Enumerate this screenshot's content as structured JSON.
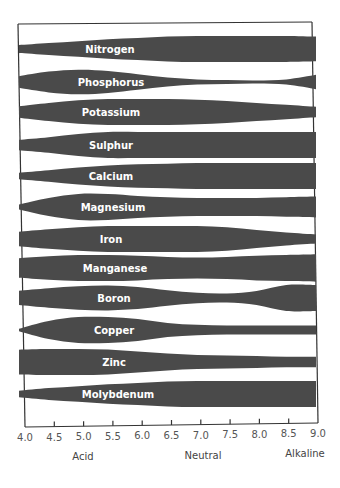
{
  "chart_data": {
    "type": "area",
    "title": "",
    "xlabel": "",
    "ylabel": "",
    "x_ticks": [
      "4.0",
      "4.5",
      "5.0",
      "5.5",
      "6.0",
      "6.5",
      "7.0",
      "7.5",
      "8.0",
      "8.5",
      "9.0"
    ],
    "xlim": [
      4.0,
      9.0
    ],
    "zone_labels": [
      {
        "label": "Acid",
        "at": 5.0
      },
      {
        "label": "Neutral",
        "at": 7.0
      },
      {
        "label": "Alkaline",
        "at": 9.0
      }
    ],
    "grid": false,
    "legend": "none",
    "band_color": "#4a4a4a",
    "x": [
      4.0,
      4.5,
      5.0,
      5.5,
      6.0,
      6.5,
      7.0,
      7.5,
      8.0,
      8.5,
      9.0
    ],
    "series": [
      {
        "name": "Nitrogen",
        "center_y": 49,
        "values": [
          0.3,
          0.45,
          0.6,
          0.75,
          0.85,
          0.95,
          1.0,
          1.0,
          1.0,
          1.0,
          0.95
        ]
      },
      {
        "name": "Phosphorus",
        "center_y": 82,
        "values": [
          0.45,
          0.8,
          0.95,
          0.85,
          0.6,
          0.35,
          0.2,
          0.15,
          0.12,
          0.2,
          0.55
        ]
      },
      {
        "name": "Potassium",
        "center_y": 112,
        "values": [
          0.45,
          0.7,
          0.9,
          1.0,
          1.0,
          1.0,
          0.95,
          0.85,
          0.7,
          0.55,
          0.4
        ]
      },
      {
        "name": "Sulphur",
        "center_y": 145,
        "values": [
          0.4,
          0.6,
          0.85,
          1.0,
          1.0,
          1.0,
          1.0,
          1.0,
          1.0,
          1.0,
          1.0
        ]
      },
      {
        "name": "Calcium",
        "center_y": 176,
        "values": [
          0.25,
          0.45,
          0.65,
          0.8,
          0.9,
          0.95,
          1.0,
          1.0,
          1.0,
          1.0,
          1.0
        ]
      },
      {
        "name": "Magnesium",
        "center_y": 207,
        "values": [
          0.2,
          0.7,
          1.0,
          1.0,
          0.85,
          0.75,
          0.7,
          0.7,
          0.7,
          0.75,
          0.8
        ]
      },
      {
        "name": "Iron",
        "center_y": 239,
        "values": [
          0.55,
          0.75,
          0.9,
          1.0,
          1.0,
          1.0,
          1.0,
          0.9,
          0.7,
          0.5,
          0.35
        ]
      },
      {
        "name": "Manganese",
        "center_y": 268,
        "values": [
          0.75,
          0.9,
          1.0,
          1.0,
          0.95,
          0.85,
          0.8,
          0.85,
          0.95,
          1.0,
          1.05
        ]
      },
      {
        "name": "Boron",
        "center_y": 298,
        "values": [
          0.55,
          0.75,
          0.9,
          0.95,
          0.85,
          0.6,
          0.4,
          0.35,
          0.55,
          1.0,
          1.0
        ]
      },
      {
        "name": "Copper",
        "center_y": 330,
        "values": [
          0.1,
          0.7,
          1.0,
          1.0,
          0.85,
          0.55,
          0.4,
          0.35,
          0.35,
          0.35,
          0.35
        ]
      },
      {
        "name": "Zinc",
        "center_y": 362,
        "values": [
          0.95,
          1.0,
          1.0,
          0.95,
          0.8,
          0.65,
          0.55,
          0.5,
          0.45,
          0.4,
          0.4
        ]
      },
      {
        "name": "Molybdenum",
        "center_y": 394,
        "values": [
          0.25,
          0.45,
          0.6,
          0.75,
          0.85,
          0.95,
          1.0,
          1.0,
          1.0,
          1.0,
          1.0
        ]
      }
    ]
  },
  "labels": {
    "nitrogen": "Nitrogen",
    "phosphorus": "Phosphorus",
    "potassium": "Potassium",
    "sulphur": "Sulphur",
    "calcium": "Calcium",
    "magnesium": "Magnesium",
    "iron": "Iron",
    "manganese": "Manganese",
    "boron": "Boron",
    "copper": "Copper",
    "zinc": "Zinc",
    "molybdenum": "Molybdenum",
    "acid": "Acid",
    "neutral": "Neutral",
    "alkaline": "Alkaline"
  }
}
